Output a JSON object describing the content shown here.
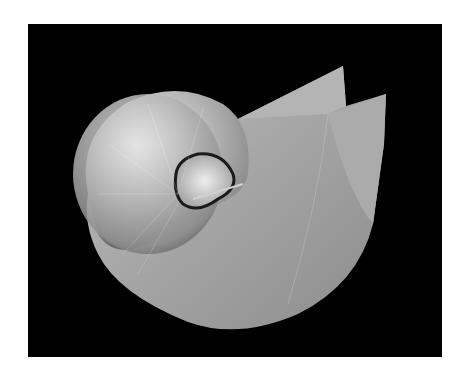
{
  "image": {
    "subject": "nautilus shell",
    "description": "Black-and-white photograph of a nautilus shell on a black background",
    "colors": {
      "page_background": "#ffffff",
      "photo_background": "#000000",
      "shell_light": "#d8d8d8",
      "shell_mid": "#a9a9a9",
      "shell_dark": "#6a6a6a"
    }
  }
}
